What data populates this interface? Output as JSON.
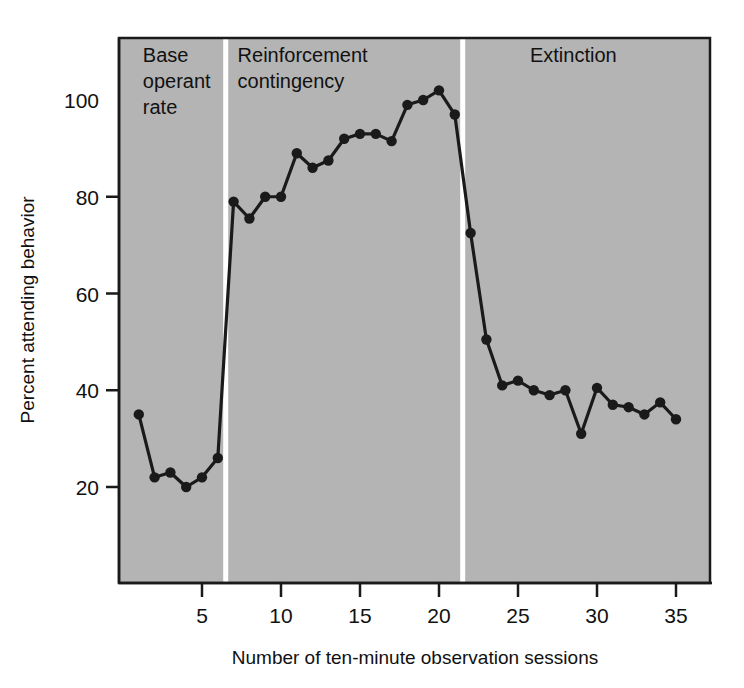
{
  "chart_data": {
    "type": "line",
    "title": "",
    "xlabel": "Number of ten-minute observation sessions",
    "ylabel": "Percent attending behavior",
    "xlim": [
      0,
      36
    ],
    "ylim": [
      0,
      112
    ],
    "xticks": [
      5,
      10,
      15,
      20,
      25,
      30,
      35
    ],
    "yticks": [
      20,
      40,
      60,
      80,
      100
    ],
    "grid": false,
    "legend": "none",
    "plot_background": "#b4b4b4",
    "line_color": "#1a1a1a",
    "marker_color": "#1a1a1a",
    "marker": "circle",
    "x": [
      1,
      2,
      3,
      4,
      5,
      6,
      7,
      8,
      9,
      10,
      11,
      12,
      13,
      14,
      15,
      16,
      17,
      18,
      19,
      20,
      21,
      22,
      23,
      24,
      25,
      26,
      27,
      28,
      29,
      30,
      31,
      32,
      33,
      34,
      35
    ],
    "values": [
      35,
      22,
      23,
      20,
      22,
      26,
      79,
      75.5,
      80,
      80,
      89,
      86,
      87.5,
      92,
      93,
      93,
      91.5,
      99,
      100,
      102,
      97,
      72.5,
      50.5,
      41,
      42,
      40,
      39,
      40,
      31,
      40.5,
      37,
      36.5,
      35,
      37.5,
      34
    ],
    "phases": [
      {
        "label": "Base\noperant\nrate",
        "label_lines": [
          "Base",
          "operant",
          "rate"
        ],
        "start": 1,
        "end": 6
      },
      {
        "label": "Reinforcement\ncontingency",
        "label_lines": [
          "Reinforcement",
          "contingency"
        ],
        "start": 7,
        "end": 21
      },
      {
        "label": "Extinction",
        "label_lines": [
          "Extinction"
        ],
        "start": 22,
        "end": 35
      }
    ],
    "phase_divider_color": "#ffffff",
    "axis_color": "#1a1a1a"
  }
}
